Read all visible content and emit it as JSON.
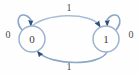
{
  "figure": {
    "width": 138,
    "height": 74,
    "background_color": "#fefefe"
  },
  "style": {
    "edge_color": "#a8bdd8",
    "edge_color_dark": "#8aa6c8",
    "arrowhead_color": "#2f4f7f",
    "node_stroke_color": "#9db3cf",
    "node_fill_color": "#ffffff",
    "text_color": "#3a3a44",
    "label_color": "#4a4a52"
  },
  "nodes": [
    {
      "id": "state-0",
      "label": "0",
      "cx": 32,
      "cy": 39,
      "r": 13
    },
    {
      "id": "state-1",
      "label": "1",
      "cx": 106,
      "cy": 39,
      "r": 13
    }
  ],
  "edges": [
    {
      "id": "self-loop-left",
      "from": "state-0",
      "to": "state-0",
      "label": "0",
      "label_x": 8,
      "label_y": 36,
      "type": "self-loop"
    },
    {
      "id": "arc-top",
      "from": "state-0",
      "to": "state-1",
      "label": "1",
      "label_x": 69,
      "label_y": 9,
      "type": "curved-arc"
    },
    {
      "id": "arc-bottom",
      "from": "state-1",
      "to": "state-0",
      "label": "1",
      "label_x": 69,
      "label_y": 68,
      "type": "curved-arc"
    },
    {
      "id": "self-loop-right",
      "from": "state-1",
      "to": "state-1",
      "label": "0",
      "label_x": 131,
      "label_y": 36,
      "type": "self-loop"
    }
  ]
}
